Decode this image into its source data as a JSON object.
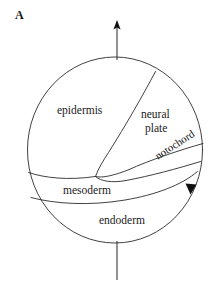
{
  "figure": {
    "panel_label": "A",
    "background_color": "#ffffff",
    "line_color": "#2b2b2b"
  },
  "labels": {
    "epidermis": "epidermis",
    "neural_plate_line1": "neural",
    "neural_plate_line2": "plate",
    "notochord": "notochord",
    "mesoderm": "mesoderm",
    "endoderm": "endoderm"
  },
  "markers": {
    "animal_vegetal_axis": "vertical-axis-line",
    "axis_arrow": "up-arrow",
    "rotation_arrow": "down-right-arrowhead"
  }
}
